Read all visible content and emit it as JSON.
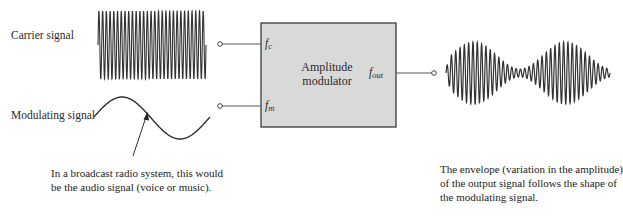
{
  "labels": {
    "carrier": "Carrier signal",
    "modulating": "Modulating signal"
  },
  "block": {
    "title_line1": "Amplitude",
    "title_line2": "modulator",
    "fill": "#d9d9d9",
    "border": "#3a3a3a",
    "ports": {
      "fc": {
        "main": "f",
        "sub": "c"
      },
      "fm": {
        "main": "f",
        "sub": "m"
      },
      "fout": {
        "main": "f",
        "sub": "out"
      }
    }
  },
  "annotations": {
    "modulating_note": {
      "line1": "In a broadcast radio system, this would",
      "line2": "be the audio signal (voice or music)."
    },
    "output_note": {
      "line1": "The envelope (variation in the amplitude)",
      "line2": "of the output signal follows the shape of",
      "line3": "the modulating signal."
    }
  },
  "signals": {
    "carrier": {
      "type": "sine",
      "cycles": 29,
      "x_start": 98,
      "x_end": 206,
      "center_y": 45,
      "amplitude": 34
    },
    "modulating": {
      "type": "sine",
      "cycles": 1,
      "x_start": 94,
      "x_end": 210,
      "center_y": 118
    },
    "output": {
      "type": "am",
      "x_start": 446,
      "x_end": 610,
      "center_y": 73,
      "max_amplitude": 31,
      "min_amplitude": 4,
      "carrier_cycles": 38
    }
  },
  "colors": {
    "stroke": "#3a3a3a",
    "wave": "#333333"
  }
}
